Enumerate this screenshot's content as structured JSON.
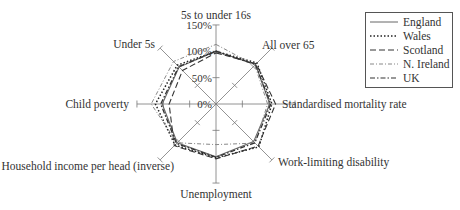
{
  "chart_data": {
    "type": "radar",
    "title": "",
    "axes": [
      "5s to under 16s",
      "All over 65",
      "Standardised mortality rate",
      "Work-limiting disability",
      "Unemployment",
      "Household income per head (inverse)",
      "Child poverty",
      "Under 5s"
    ],
    "radial_ticks": [
      "0%",
      "50%",
      "100%",
      "150%"
    ],
    "radial_range": [
      0,
      150
    ],
    "series": [
      {
        "name": "England",
        "style": "solid",
        "values": [
          100,
          106,
          102,
          101,
          100,
          104,
          102,
          99
        ]
      },
      {
        "name": "Wales",
        "style": "dotted",
        "values": [
          100,
          110,
          106,
          115,
          102,
          110,
          115,
          104
        ]
      },
      {
        "name": "Scotland",
        "style": "dashed",
        "values": [
          97,
          108,
          113,
          113,
          104,
          112,
          89,
          90
        ]
      },
      {
        "name": "N. Ireland",
        "style": "dashdot",
        "values": [
          113,
          104,
          98,
          105,
          77,
          104,
          123,
          114
        ]
      },
      {
        "name": "UK",
        "style": "dashdot2",
        "values": [
          100,
          106,
          104,
          104,
          101,
          106,
          105,
          100
        ]
      }
    ],
    "legend_position": "top-right"
  },
  "legend": {
    "items": [
      {
        "label": "England"
      },
      {
        "label": "Wales"
      },
      {
        "label": "Scotland"
      },
      {
        "label": "N. Ireland"
      },
      {
        "label": "UK"
      }
    ]
  }
}
